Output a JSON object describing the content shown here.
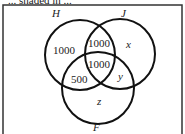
{
  "cropped_header_text": "... shaded in ...",
  "diagram": {
    "type": "venn",
    "sets": [
      {
        "name": "H",
        "label": "H"
      },
      {
        "name": "J",
        "label": "J"
      },
      {
        "name": "F",
        "label": "F"
      }
    ],
    "regions": {
      "H_only": "1000",
      "H_and_J_only": "1000",
      "H_and_J_and_F": "1000",
      "H_and_F_only": "500",
      "J_only": "x",
      "J_and_F_only": "y",
      "F_only": "z"
    },
    "line_color": "#111111",
    "background": "#ffffff"
  }
}
